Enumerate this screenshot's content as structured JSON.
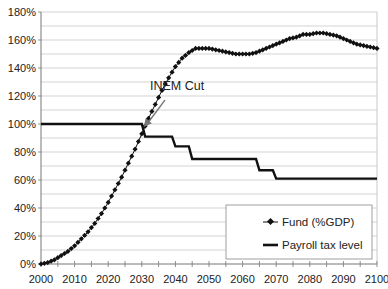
{
  "chart_data": {
    "type": "line",
    "title": "",
    "xlabel": "",
    "ylabel": "",
    "xlim": [
      2000,
      2100
    ],
    "ylim": [
      0,
      180
    ],
    "x_ticks": [
      2000,
      2010,
      2020,
      2030,
      2040,
      2050,
      2060,
      2070,
      2080,
      2090,
      2100
    ],
    "x_tick_labels": [
      "2000",
      "2010",
      "2020",
      "2030",
      "2040",
      "2050",
      "2060",
      "2070",
      "2080",
      "2090",
      "2100"
    ],
    "y_ticks": [
      0,
      20,
      40,
      60,
      80,
      100,
      120,
      140,
      160,
      180
    ],
    "y_tick_labels": [
      "0%",
      "20%",
      "40%",
      "60%",
      "80%",
      "100%",
      "120%",
      "140%",
      "160%",
      "180%"
    ],
    "grid": {
      "major_y_step": 20,
      "minor_y_step": 10,
      "on": true
    },
    "legend_position": "lower right",
    "series": [
      {
        "name": "Fund (%GDP)",
        "style": "line-with-diamond-markers",
        "color": "#111111",
        "x": [
          2000,
          2002,
          2004,
          2006,
          2008,
          2010,
          2012,
          2014,
          2016,
          2018,
          2020,
          2022,
          2024,
          2026,
          2028,
          2030,
          2032,
          2034,
          2036,
          2038,
          2040,
          2042,
          2044,
          2046,
          2048,
          2050,
          2052,
          2054,
          2056,
          2058,
          2060,
          2062,
          2064,
          2066,
          2068,
          2070,
          2072,
          2074,
          2076,
          2078,
          2080,
          2082,
          2084,
          2086,
          2088,
          2090,
          2092,
          2094,
          2096,
          2098,
          2100
        ],
        "values": [
          0,
          1,
          3,
          6,
          9,
          13,
          18,
          23,
          29,
          36,
          44,
          53,
          62,
          72,
          82,
          93,
          104,
          114,
          124,
          133,
          141,
          147,
          151,
          154,
          154,
          154,
          153,
          152,
          151,
          150,
          150,
          150,
          151,
          153,
          155,
          157,
          159,
          161,
          162,
          164,
          164,
          165,
          165,
          164,
          163,
          161,
          159,
          157,
          156,
          155,
          154
        ]
      },
      {
        "name": "Payroll tax level",
        "style": "thick-step-line",
        "color": "#111111",
        "x": [
          2000,
          2030,
          2031,
          2039,
          2040,
          2044,
          2045,
          2064,
          2065,
          2069,
          2070,
          2100
        ],
        "values": [
          100,
          100,
          91,
          91,
          84,
          84,
          75,
          75,
          67,
          67,
          61,
          61
        ]
      }
    ],
    "annotations": [
      {
        "text": "INEM Cut",
        "x": 2037,
        "y": 108,
        "arrow_to": {
          "x": 2030,
          "y": 100
        }
      }
    ]
  },
  "legend": {
    "items": [
      {
        "label": "Fund (%GDP)"
      },
      {
        "label": "Payroll tax level"
      }
    ]
  },
  "annotation": {
    "label": "INEM Cut"
  }
}
